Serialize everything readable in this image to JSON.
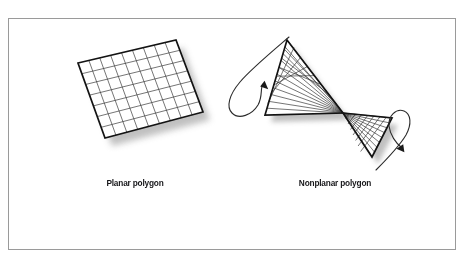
{
  "figure": {
    "type": "diagram",
    "background_color": "#ffffff",
    "frame": {
      "name": "outer-border-frame",
      "x": 8,
      "y": 18,
      "width": 448,
      "height": 232,
      "stroke_color": "#9a9a9a",
      "stroke_width": 1,
      "fill": "none"
    },
    "shadow_color": "#b4b4b4",
    "line_color": "#1a1a1a",
    "fill_color": "#ffffff",
    "captions": {
      "planar": "Planar polygon",
      "nonplanar": "Nonplanar polygon"
    },
    "planar_polygon": {
      "name": "planar-polygon-grid",
      "description": "Tilted rectangular quad mesh lying flat in a single plane",
      "corners": {
        "top_left": [
          78,
          63
        ],
        "top_right": [
          176,
          40
        ],
        "bottom_right": [
          203,
          112
        ],
        "bottom_left": [
          105,
          138
        ]
      },
      "grid_columns": 9,
      "grid_rows": 7,
      "shadow_offset": [
        7,
        8
      ]
    },
    "nonplanar_polygon": {
      "name": "nonplanar-polygon-bowtie",
      "description": "Two triangular fans twisted about a shared central vertex forming a bowtie",
      "center_vertex": [
        343,
        113
      ],
      "left_triangle": {
        "apex": [
          343,
          113
        ],
        "top": [
          287,
          40
        ],
        "bottom": [
          265,
          115
        ],
        "fan_lines": 11,
        "band_lines": 7
      },
      "right_triangle": {
        "apex": [
          343,
          113
        ],
        "top": [
          392,
          118
        ],
        "bottom": [
          372,
          157
        ],
        "fan_lines": 9,
        "band_lines": 6
      },
      "shadow_offset": [
        6,
        7
      ],
      "arrows": [
        {
          "name": "rotation-arrow-left",
          "direction": "counterclockwise",
          "head_at": [
            264,
            83
          ],
          "head_angle_deg": -55
        },
        {
          "name": "rotation-arrow-right",
          "direction": "clockwise",
          "head_at": [
            403,
            150
          ],
          "head_angle_deg": 125
        }
      ]
    }
  }
}
